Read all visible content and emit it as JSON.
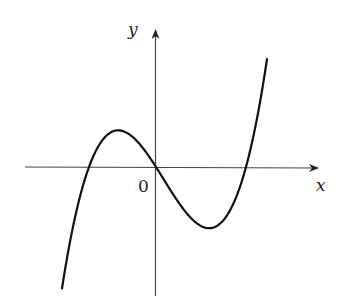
{
  "diagram": {
    "type": "function-graph",
    "axes": {
      "x_label": "x",
      "y_label": "y",
      "origin_label": "0"
    },
    "curve": {
      "kind": "cubic",
      "roots_px": [
        89,
        156,
        246
      ],
      "local_max_px": [
        119,
        131
      ],
      "local_min_px": [
        209,
        228
      ],
      "color": "#111111"
    },
    "colors": {
      "axis": "#333333",
      "curve": "#111111",
      "background": "#ffffff"
    }
  },
  "chart_data": {
    "type": "line",
    "title": "",
    "xlabel": "x",
    "ylabel": "y",
    "grid": false,
    "annotations": [
      "0"
    ],
    "series": [
      {
        "name": "f(x) cubic",
        "shape": "rises from bottom-left, crosses x-axis left of origin, local max left of y-axis, passes through origin, local min right of y-axis, crosses x-axis, rises to top-right",
        "roots_relative": [
          -0.74,
          0,
          1
        ],
        "local_max_relative": [
          -0.41,
          0.4
        ],
        "local_min_relative": [
          0.59,
          -0.68
        ]
      }
    ]
  }
}
